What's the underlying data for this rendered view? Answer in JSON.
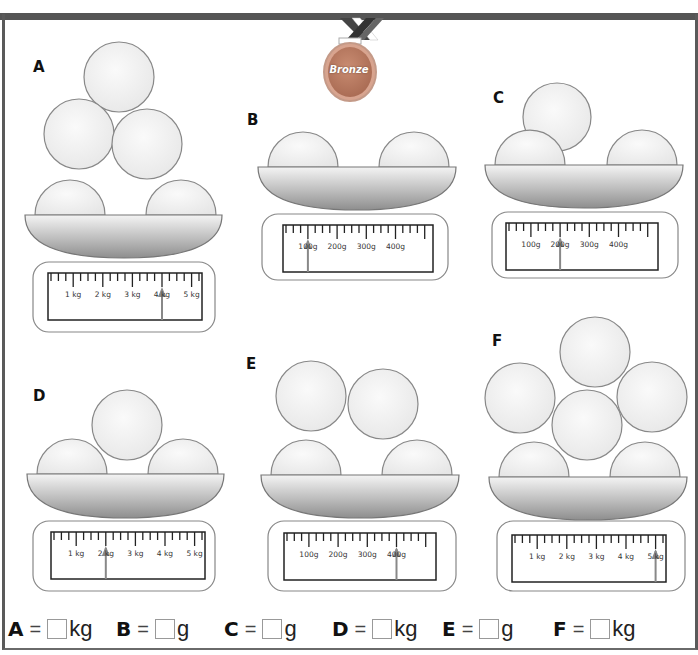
{
  "badge": {
    "label": "Bronze",
    "color": "#b97c62"
  },
  "panels": [
    {
      "id": "A",
      "label": "A",
      "unit": "kg",
      "scale_labels": [
        "1 kg",
        "2 kg",
        "3 kg",
        "4 kg",
        "5 kg"
      ],
      "reading": "4 kg",
      "balls": 5
    },
    {
      "id": "B",
      "label": "B",
      "unit": "g",
      "scale_labels": [
        "100g",
        "200g",
        "300g",
        "400g"
      ],
      "reading": "100g",
      "balls": 2
    },
    {
      "id": "C",
      "label": "C",
      "unit": "g",
      "scale_labels": [
        "100g",
        "200g",
        "300g",
        "400g"
      ],
      "reading": "200g",
      "balls": 3
    },
    {
      "id": "D",
      "label": "D",
      "unit": "kg",
      "scale_labels": [
        "1 kg",
        "2 kg",
        "3 kg",
        "4 kg",
        "5 kg"
      ],
      "reading": "2 kg",
      "balls": 3
    },
    {
      "id": "E",
      "label": "E",
      "unit": "g",
      "scale_labels": [
        "100g",
        "200g",
        "300g",
        "400g"
      ],
      "reading": "400g",
      "balls": 4
    },
    {
      "id": "F",
      "label": "F",
      "unit": "kg",
      "scale_labels": [
        "1 kg",
        "2 kg",
        "3 kg",
        "4 kg",
        "5 kg"
      ],
      "reading": "5 kg",
      "balls": 6
    }
  ],
  "answers": [
    {
      "label": "A",
      "eq": "=",
      "value": "",
      "unit": "kg"
    },
    {
      "label": "B",
      "eq": "=",
      "value": "",
      "unit": "g"
    },
    {
      "label": "C",
      "eq": "=",
      "value": "",
      "unit": "g"
    },
    {
      "label": "D",
      "eq": "=",
      "value": "",
      "unit": "kg"
    },
    {
      "label": "E",
      "eq": "=",
      "value": "",
      "unit": "g"
    },
    {
      "label": "F",
      "eq": "=",
      "value": "",
      "unit": "kg"
    }
  ]
}
